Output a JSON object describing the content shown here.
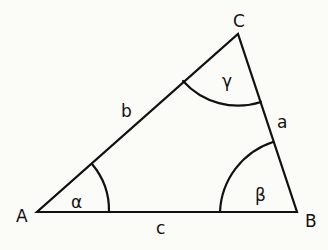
{
  "diagram": {
    "vertices": [
      {
        "label": "A",
        "x": 37,
        "y": 212
      },
      {
        "label": "B",
        "x": 297,
        "y": 212
      },
      {
        "label": "C",
        "x": 238,
        "y": 34
      }
    ],
    "sides": [
      {
        "label": "a",
        "between": "B-C"
      },
      {
        "label": "b",
        "between": "A-C"
      },
      {
        "label": "c",
        "between": "A-B"
      }
    ],
    "angles": [
      {
        "label": "α",
        "vertex": "A"
      },
      {
        "label": "β",
        "vertex": "B"
      },
      {
        "label": "γ",
        "vertex": "C"
      }
    ]
  }
}
